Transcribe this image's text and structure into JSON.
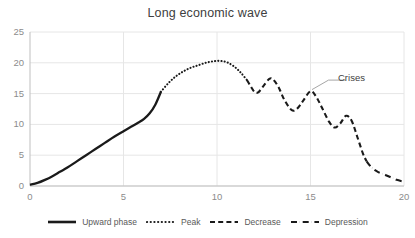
{
  "chart_data": {
    "type": "line",
    "title": "Long economic wave",
    "xlabel": "",
    "ylabel": "",
    "xlim": [
      0,
      20
    ],
    "ylim": [
      0,
      25
    ],
    "xticks": [
      "0",
      "5",
      "10",
      "15",
      "20"
    ],
    "yticks": [
      "0",
      "5",
      "10",
      "15",
      "20",
      "25"
    ],
    "grid": true,
    "legend_position": "bottom",
    "annotations": [
      {
        "text": "Crises",
        "points_to_x": 15.0,
        "points_to_y": 15.4
      }
    ],
    "series": [
      {
        "name": "Upward phase",
        "style": "solid",
        "color": "#1a1a1a",
        "x": [
          0.0,
          0.4,
          0.8,
          1.2,
          1.6,
          2.0,
          2.5,
          3.0,
          3.5,
          4.0,
          4.5,
          5.0,
          5.4,
          5.8,
          6.1,
          6.4,
          6.7,
          7.0
        ],
        "y": [
          0.2,
          0.5,
          1.0,
          1.6,
          2.3,
          3.0,
          4.0,
          5.0,
          6.0,
          7.0,
          8.0,
          8.9,
          9.6,
          10.3,
          10.9,
          11.8,
          13.2,
          15.3
        ]
      },
      {
        "name": "Peak",
        "style": "dotted",
        "color": "#1a1a1a",
        "x": [
          7.0,
          7.4,
          7.8,
          8.2,
          8.6,
          9.0,
          9.4,
          9.8,
          10.2,
          10.6,
          11.0,
          11.3,
          11.6
        ],
        "y": [
          15.3,
          16.7,
          17.8,
          18.6,
          19.2,
          19.6,
          20.0,
          20.25,
          20.3,
          20.0,
          19.2,
          18.3,
          17.2
        ]
      },
      {
        "name": "Decrease",
        "style": "dashed",
        "color": "#1a1a1a",
        "x": [
          11.6,
          11.8,
          12.0,
          12.2,
          12.5,
          12.8,
          13.0,
          13.3,
          13.6,
          14.0,
          14.3,
          14.6,
          15.0,
          15.3,
          15.6,
          16.0,
          16.3,
          16.6,
          16.9,
          17.2,
          17.5,
          17.8,
          18.0
        ],
        "y": [
          17.2,
          16.2,
          15.3,
          15.2,
          16.3,
          17.4,
          17.3,
          16.0,
          14.0,
          12.3,
          12.6,
          13.8,
          15.4,
          14.5,
          12.8,
          10.4,
          9.5,
          10.2,
          11.4,
          10.6,
          8.0,
          5.3,
          4.0
        ]
      },
      {
        "name": "Depression",
        "style": "dashdot",
        "color": "#1a1a1a",
        "x": [
          18.0,
          18.3,
          18.6,
          19.0,
          19.3,
          19.6,
          20.0
        ],
        "y": [
          4.0,
          2.9,
          2.3,
          1.8,
          1.4,
          1.0,
          0.7
        ]
      }
    ]
  },
  "legend": {
    "items": [
      {
        "label": "Upward phase",
        "style": "solid"
      },
      {
        "label": "Peak",
        "style": "dotted"
      },
      {
        "label": "Decrease",
        "style": "dashed"
      },
      {
        "label": "Depression",
        "style": "dashdot"
      }
    ]
  },
  "colors": {
    "line": "#1a1a1a",
    "grid": "#e6e6e6",
    "axis": "#bfbfbf",
    "tick_text": "#8c8c8c",
    "title_text": "#404040",
    "leader": "#a6a6a6"
  }
}
